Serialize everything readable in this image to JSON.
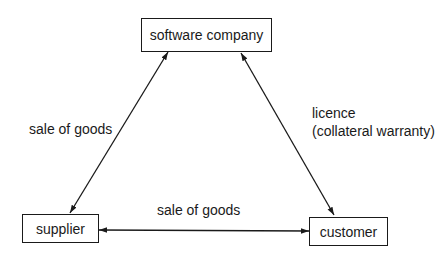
{
  "diagram": {
    "nodes": {
      "software_company": {
        "label": "software company"
      },
      "supplier": {
        "label": "supplier"
      },
      "customer": {
        "label": "customer"
      }
    },
    "edges": {
      "supplier_software": {
        "label": "sale of goods",
        "from": "supplier",
        "to": "software company",
        "bidirectional": true
      },
      "software_customer": {
        "label_line1": "licence",
        "label_line2": "(collateral warranty)",
        "from": "software company",
        "to": "customer",
        "bidirectional": true
      },
      "supplier_customer": {
        "label": "sale of goods",
        "from": "supplier",
        "to": "customer",
        "bidirectional": true
      }
    },
    "colors": {
      "line": "#1a1a1a",
      "background": "#ffffff"
    }
  }
}
